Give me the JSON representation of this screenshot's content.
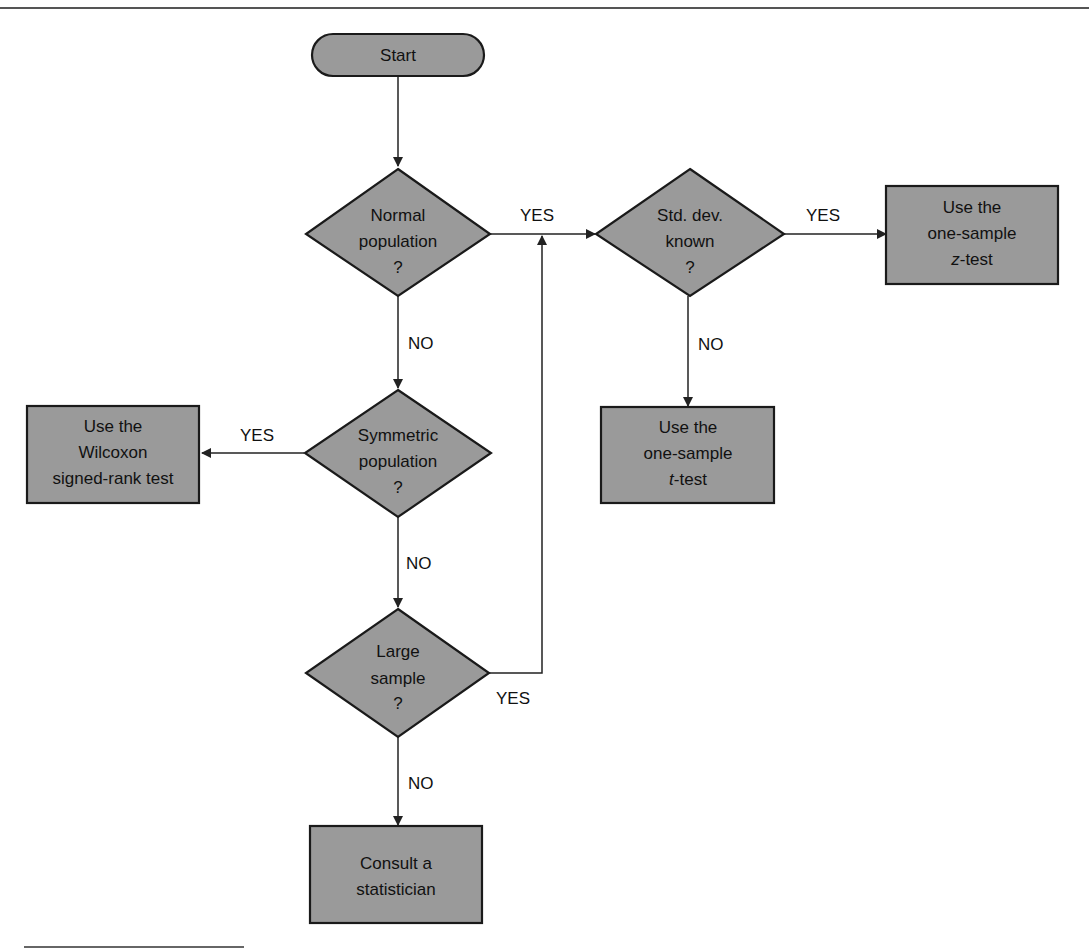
{
  "diagram": {
    "type": "flowchart",
    "nodes": {
      "start": {
        "label": "Start",
        "shape": "terminator"
      },
      "normal": {
        "lines": [
          "Normal",
          "population",
          "?"
        ],
        "shape": "decision"
      },
      "stddev": {
        "lines": [
          "Std. dev.",
          "known",
          "?"
        ],
        "shape": "decision"
      },
      "ztest": {
        "lines": [
          "Use the",
          "one-sample",
          "z",
          "-test"
        ],
        "shape": "process"
      },
      "ttest": {
        "lines": [
          "Use the",
          "one-sample",
          "t",
          "-test"
        ],
        "shape": "process"
      },
      "symmetric": {
        "lines": [
          "Symmetric",
          "population",
          "?"
        ],
        "shape": "decision"
      },
      "wilcoxon": {
        "lines": [
          "Use the",
          "Wilcoxon",
          "signed-rank test"
        ],
        "shape": "process"
      },
      "large": {
        "lines": [
          "Large",
          "sample",
          "?"
        ],
        "shape": "decision"
      },
      "consult": {
        "lines": [
          "Consult a",
          "statistician"
        ],
        "shape": "process"
      }
    },
    "edges": [
      {
        "from": "start",
        "to": "normal",
        "label": ""
      },
      {
        "from": "normal",
        "to": "stddev",
        "label": "YES"
      },
      {
        "from": "normal",
        "to": "symmetric",
        "label": "NO"
      },
      {
        "from": "stddev",
        "to": "ztest",
        "label": "YES"
      },
      {
        "from": "stddev",
        "to": "ttest",
        "label": "NO"
      },
      {
        "from": "symmetric",
        "to": "wilcoxon",
        "label": "YES"
      },
      {
        "from": "symmetric",
        "to": "large",
        "label": "NO"
      },
      {
        "from": "large",
        "to": "stddev",
        "label": "YES"
      },
      {
        "from": "large",
        "to": "consult",
        "label": "NO"
      }
    ],
    "labels": {
      "yes": "YES",
      "no": "NO"
    },
    "colors": {
      "fill": "#9a9a9a",
      "stroke": "#1a1a1a",
      "text": "#111111"
    }
  }
}
